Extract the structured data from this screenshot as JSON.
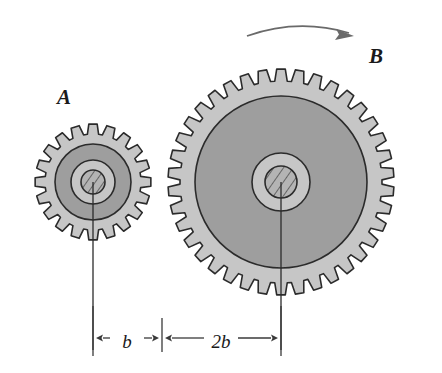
{
  "figure": {
    "background_color": "#ffffff"
  },
  "colors": {
    "outline": "#2b2b2b",
    "rim_fill": "#c6c6c6",
    "web_fill": "#9e9e9e",
    "hub_fill": "#c6c6c6",
    "bore_fill": "#b0b0b0",
    "hatch_line": "#3a3a3a",
    "dimension_line": "#3a3a3a",
    "center_line": "#2b2b2b",
    "rotation_arrow": "#6a6a6a",
    "text": "#1a1a1a"
  },
  "gears": [
    {
      "id": "A",
      "label": "A",
      "label_x": 57,
      "label_y": 104,
      "center_x": 93,
      "center_y": 182,
      "teeth": 20,
      "outer_radius": 58,
      "root_radius": 48,
      "web_radius": 38,
      "hub_radius": 22,
      "bore_radius": 12,
      "tooth_width_ratio": 0.46
    },
    {
      "id": "B",
      "label": "B",
      "label_x": 369,
      "label_y": 63,
      "center_x": 281,
      "center_y": 182,
      "teeth": 38,
      "outer_radius": 113,
      "root_radius": 101,
      "web_radius": 86,
      "hub_radius": 29,
      "bore_radius": 16,
      "tooth_width_ratio": 0.46
    }
  ],
  "center_lines": [
    {
      "name": "gear-a-center-line",
      "x": 93,
      "y_top": 182,
      "y_bottom": 350
    },
    {
      "name": "gear-b-center-line",
      "x": 281,
      "y_top": 182,
      "y_bottom": 350
    }
  ],
  "dimensions": {
    "line_y": 338,
    "items": [
      {
        "label": "b",
        "x_start": 93,
        "x_end": 162,
        "label_x": 127,
        "label_y": 344
      },
      {
        "label": "2b",
        "x_start": 162,
        "x_end": 281,
        "label_x": 221,
        "label_y": 344
      }
    ],
    "extension_lines": [
      {
        "x": 93,
        "y_top": 306,
        "y_bottom": 356
      },
      {
        "x": 162,
        "y_top": 318,
        "y_bottom": 352
      },
      {
        "x": 281,
        "y_top": 306,
        "y_bottom": 356
      }
    ]
  },
  "rotation_arrow": {
    "name": "rotation-direction-arrow",
    "description": "curved arrow above gear B indicating clockwise rotation",
    "start_x": 247,
    "start_y": 36,
    "control_x": 298,
    "control_y": 18,
    "end_x": 349,
    "end_y": 33,
    "direction": "clockwise"
  }
}
